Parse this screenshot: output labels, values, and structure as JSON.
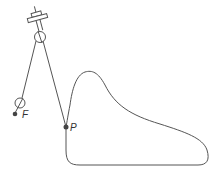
{
  "diagram": {
    "labels": {
      "F": "F",
      "P": "P"
    },
    "colors": {
      "stroke": "#555555",
      "point": "#444444",
      "background": "#ffffff"
    },
    "elements": [
      "ceiling-mount",
      "pulley",
      "weight-ring",
      "fixed-point-F",
      "point-P",
      "closed-curve"
    ]
  }
}
